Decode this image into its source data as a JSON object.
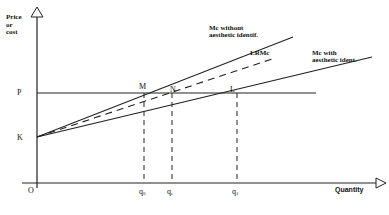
{
  "diagram": {
    "y_axis_label_lines": [
      "Price",
      "or",
      "cost"
    ],
    "x_axis_label": "Quantity",
    "origin_label": "O",
    "price_level_label": "P",
    "intercept_label": "K",
    "points": {
      "M": "M",
      "N": "N",
      "L": "L"
    },
    "curves": {
      "mc_without": [
        "Mc without",
        "aesthetic identif."
      ],
      "lrmc": "LRMc",
      "mc_with": [
        "Mc with",
        "aesthetic ident."
      ]
    },
    "quantity_ticks": {
      "q0": {
        "base": "q",
        "sub": "0"
      },
      "qe": {
        "base": "q",
        "sub": "e"
      },
      "q1": {
        "base": "q",
        "sub": "1"
      }
    },
    "colors": {
      "line": "#222222",
      "background": "#ffffff"
    }
  }
}
